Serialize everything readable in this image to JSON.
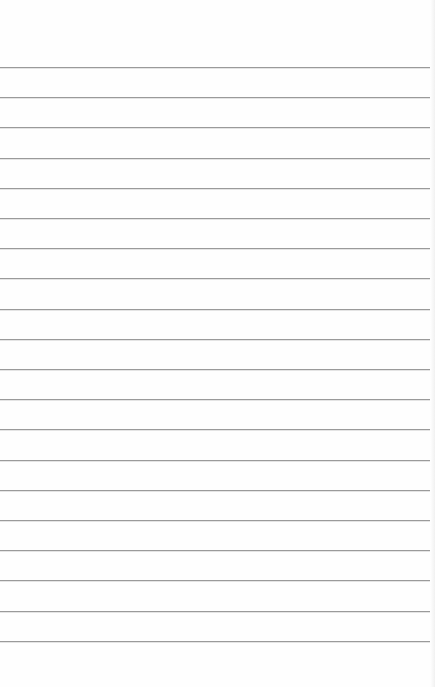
{
  "image": {
    "subject": "blank lined notepaper",
    "background_color": "#fefefe",
    "line_color": "#9a9a9a",
    "line_count": 20,
    "first_line_y": 67,
    "line_spacing": 30.2,
    "line_left_x": 0,
    "line_right_x": 430
  }
}
